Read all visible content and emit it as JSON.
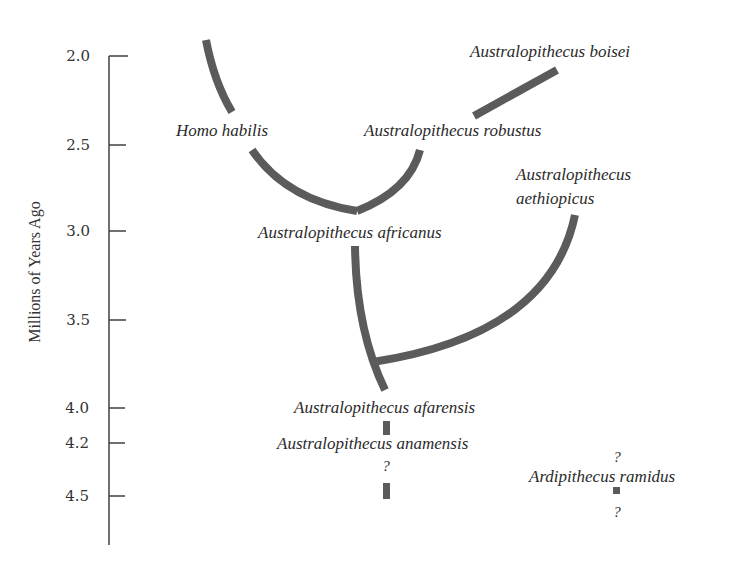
{
  "axis": {
    "title": "Millions of Years Ago",
    "ticks": [
      {
        "label": "2.0",
        "y": 56
      },
      {
        "label": "2.5",
        "y": 145
      },
      {
        "label": "3.0",
        "y": 231
      },
      {
        "label": "3.5",
        "y": 320
      },
      {
        "label": "4.0",
        "y": 408
      },
      {
        "label": "4.2",
        "y": 443
      },
      {
        "label": "4.5",
        "y": 496
      }
    ]
  },
  "species": {
    "boisei": "Australopithecus boisei",
    "habilis": "Homo habilis",
    "robustus": "Australopithecus robustus",
    "aethiopicus_line1": "Australopithecus",
    "aethiopicus_line2": "aethiopicus",
    "africanus": "Australopithecus africanus",
    "afarensis": "Australopithecus afarensis",
    "anamensis": "Australopithecus anamensis",
    "ramidus": "Ardipithecus ramidus"
  },
  "uncertainty": {
    "anamensis_below": "?",
    "ramidus_above": "?",
    "ramidus_below": "?"
  },
  "colors": {
    "branch": "#5b5b5b",
    "axis": "#333333",
    "text": "#2a2a2a"
  }
}
